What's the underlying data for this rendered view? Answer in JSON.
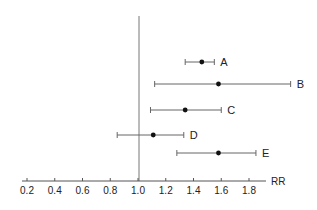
{
  "chart_data": {
    "type": "forest",
    "title": "",
    "xlabel": "RR",
    "ylabel": "",
    "xlim": [
      0.2,
      1.9
    ],
    "xticks": [
      0.2,
      0.4,
      0.6,
      0.8,
      1.0,
      1.2,
      1.4,
      1.6,
      1.8
    ],
    "xtick_labels": [
      "0.2",
      "0.4",
      "0.6",
      "0.8",
      "1.0",
      "1.2",
      "1.4",
      "1.6",
      "1.8"
    ],
    "reference_line": 1.0,
    "grid": false,
    "legend": null,
    "series": [
      {
        "name": "A",
        "estimate": 1.46,
        "lower": 1.34,
        "upper": 1.55
      },
      {
        "name": "B",
        "estimate": 1.58,
        "lower": 1.12,
        "upper": 2.1
      },
      {
        "name": "C",
        "estimate": 1.34,
        "lower": 1.09,
        "upper": 1.6
      },
      {
        "name": "D",
        "estimate": 1.11,
        "lower": 0.85,
        "upper": 1.33
      },
      {
        "name": "E",
        "estimate": 1.58,
        "lower": 1.28,
        "upper": 1.85
      }
    ]
  },
  "colors": {
    "axis": "#555555",
    "line": "#666666",
    "point": "#111111",
    "text": "#222222"
  }
}
